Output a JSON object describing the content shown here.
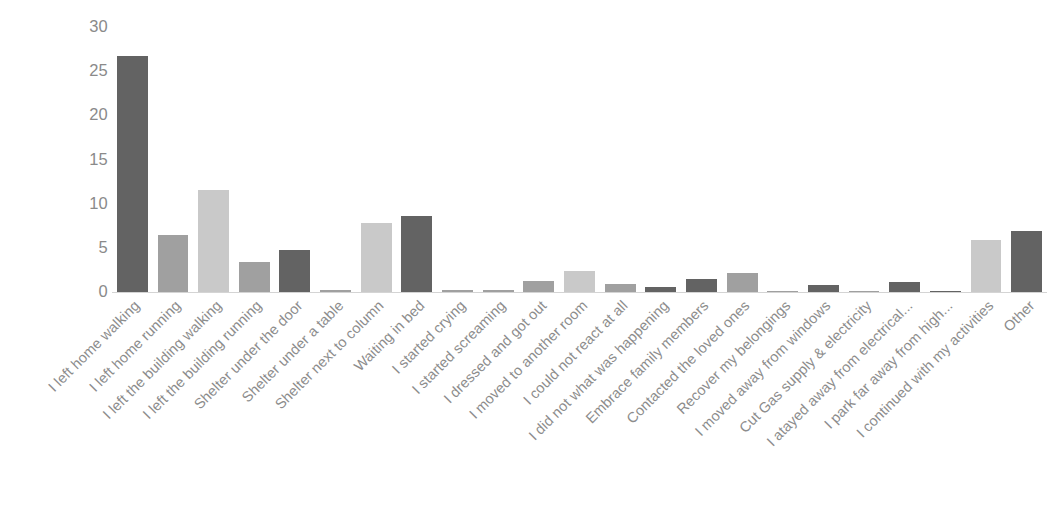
{
  "chart_data": {
    "type": "bar",
    "title": "",
    "subtitle": "",
    "xlabel": "",
    "ylabel": "",
    "ylim": [
      0,
      30
    ],
    "yticks": [
      0,
      5,
      10,
      15,
      20,
      25,
      30
    ],
    "ytick_labels": [
      "0",
      "5",
      "10",
      "15",
      "20",
      "25",
      "30"
    ],
    "grid": false,
    "legend": "none",
    "label_rotation_deg": -45,
    "categories": [
      "I left home walking",
      "I left home running",
      "I left the building walking",
      "I left the building running",
      "Shelter under the door",
      "Shelter under a table",
      "Shelter next to column",
      "Waiting in bed",
      "I started crying",
      "I started screaming",
      "I dressed and got out",
      "I moved to another room",
      "I could not react at all",
      "I did not what was happening",
      "Embrace family members",
      "Contacted the loved ones",
      "Recover my belongings",
      "I moved away from windows",
      "Cut Gas supply & electricity",
      "I atayed away from electrical...",
      "I park far away from high...",
      "I continued with my activities",
      "Other"
    ],
    "values": [
      26.7,
      6.5,
      11.6,
      3.4,
      4.8,
      0.2,
      7.8,
      8.6,
      0.2,
      0.2,
      1.2,
      2.4,
      0.9,
      0.6,
      1.5,
      2.2,
      0.1,
      0.8,
      0.1,
      1.1,
      0.15,
      5.9,
      6.9
    ],
    "bar_colors": [
      "#636363",
      "#a0a0a0",
      "#c9c9c9",
      "#a0a0a0",
      "#636363",
      "#a0a0a0",
      "#c9c9c9",
      "#636363",
      "#a0a0a0",
      "#a0a0a0",
      "#a0a0a0",
      "#c9c9c9",
      "#a0a0a0",
      "#636363",
      "#636363",
      "#a0a0a0",
      "#a0a0a0",
      "#636363",
      "#a0a0a0",
      "#636363",
      "#636363",
      "#c9c9c9",
      "#636363"
    ],
    "colors": {
      "dark": "#636363",
      "medium": "#a0a0a0",
      "light": "#c9c9c9",
      "axis_text": "#8a8a8a",
      "label_text": "#8c8c8c",
      "baseline": "#d4d4d4",
      "background": "#ffffff"
    }
  }
}
